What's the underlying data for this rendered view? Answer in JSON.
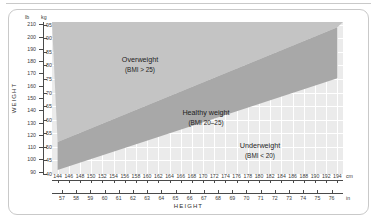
{
  "chart_data": {
    "type": "area",
    "title": "",
    "xlabel": "HEIGHT",
    "ylabel": "WEIGHT",
    "grid": true,
    "legend": "none",
    "axes": {
      "x_primary": {
        "unit": "cm",
        "ticks": [
          144,
          146,
          148,
          150,
          152,
          154,
          156,
          158,
          160,
          162,
          164,
          166,
          168,
          170,
          172,
          174,
          176,
          178,
          180,
          182,
          184,
          186,
          188,
          190,
          192,
          194
        ],
        "range": [
          143,
          195
        ]
      },
      "x_secondary": {
        "unit": "in",
        "ticks": [
          57,
          58,
          59,
          60,
          61,
          62,
          63,
          64,
          65,
          66,
          67,
          68,
          69,
          70,
          71,
          72,
          73,
          74,
          75,
          76
        ],
        "range": [
          56.3,
          76.8
        ]
      },
      "y_primary": {
        "unit": "lb",
        "ticks": [
          210,
          200,
          190,
          180,
          170,
          160,
          150,
          140,
          130,
          120,
          110,
          100,
          90
        ],
        "range": [
          88,
          212
        ]
      },
      "y_secondary": {
        "unit": "kg",
        "ticks": [
          95,
          90,
          85,
          80,
          75,
          70,
          65,
          60,
          55,
          50,
          45,
          40
        ],
        "range": [
          40,
          96
        ]
      }
    },
    "regions": [
      {
        "name": "overweight",
        "label": "Overweight",
        "sublabel": "(BMI > 25)",
        "bmi_min": 25,
        "bmi_max": null,
        "color": "#c4c4c4"
      },
      {
        "name": "healthy",
        "label": "Healthy weight",
        "sublabel": "(BMI 20–25)",
        "bmi_min": 20,
        "bmi_max": 25,
        "color": "#a8a8a8"
      },
      {
        "name": "underweight",
        "label": "Underweight",
        "sublabel": "(BMI < 20)",
        "bmi_min": null,
        "bmi_max": 20,
        "color": "#ebebeb"
      }
    ],
    "boundary_bmi25_kg": [
      {
        "height_cm": 144,
        "weight_kg": 51.8
      },
      {
        "height_cm": 194,
        "weight_kg": 94.1
      }
    ],
    "boundary_bmi20_kg": [
      {
        "height_cm": 144,
        "weight_kg": 41.5
      },
      {
        "height_cm": 194,
        "weight_kg": 75.3
      }
    ]
  },
  "axis_titles": {
    "weight": "WEIGHT",
    "height": "HEIGHT"
  },
  "units": {
    "lb": "lb",
    "kg": "kg",
    "cm": "cm",
    "in": "in"
  },
  "colors": {
    "plot_background": "#ebebeb",
    "gridline": "#ffffff",
    "healthy_band": "#a8a8a8",
    "overweight_band": "#c4c4c4",
    "axis": "#4a4a4a",
    "frame": "#c9c9c9",
    "text": "#1d1d1d"
  }
}
